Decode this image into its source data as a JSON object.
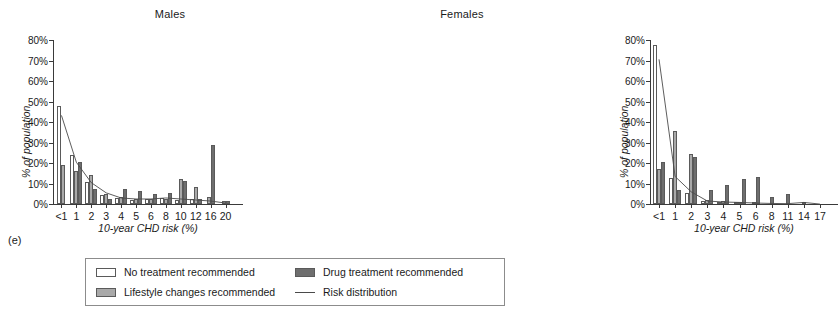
{
  "panel_label": "(e)",
  "legend": {
    "items": [
      {
        "key": "no_treatment",
        "label": "No treatment recommended",
        "marker": "swatch-white",
        "color": "#ffffff"
      },
      {
        "key": "drug",
        "label": "Drug treatment recommended",
        "marker": "swatch-dark-gray",
        "color": "#6e6e6e"
      },
      {
        "key": "lifestyle",
        "label": "Lifestyle changes recommended",
        "marker": "swatch-light-gray",
        "color": "#a9a9a9"
      },
      {
        "key": "risk",
        "label": "Risk distribution",
        "marker": "line",
        "color": "#4a4a4a"
      }
    ]
  },
  "chart_data": [
    {
      "type": "bar",
      "id": "males",
      "title": "Males",
      "xlabel": "10-year CHD risk (%)",
      "ylabel": "% of population",
      "ylim": [
        0,
        80
      ],
      "yticks": [
        "0%",
        "10%",
        "20%",
        "30%",
        "40%",
        "50%",
        "60%",
        "70%",
        "80%"
      ],
      "ytick_values": [
        0,
        10,
        20,
        30,
        40,
        50,
        60,
        70,
        80
      ],
      "grid": false,
      "legend_position": "below-figure",
      "categories": [
        "<1",
        "1",
        "2",
        "3",
        "4",
        "5",
        "6",
        "8",
        "10",
        "12",
        "16",
        "20"
      ],
      "series": [
        {
          "name": "No treatment recommended",
          "color": "#ffffff",
          "values": [
            48,
            24,
            10.5,
            4.5,
            3,
            2,
            2.5,
            3,
            2,
            2.5,
            0,
            0
          ]
        },
        {
          "name": "Lifestyle changes recommended",
          "color": "#a9a9a9",
          "values": [
            19,
            16,
            14,
            5,
            3.5,
            2.5,
            2.5,
            2.5,
            12,
            8.5,
            3.5,
            1.5
          ]
        },
        {
          "name": "Drug treatment recommended",
          "color": "#6e6e6e",
          "values": [
            0,
            20.5,
            7.5,
            2.5,
            7.5,
            6.5,
            5,
            5.5,
            11,
            2.5,
            29,
            1.5
          ]
        }
      ],
      "risk_distribution": {
        "name": "Risk distribution",
        "color": "#4a4a4a",
        "values": [
          43.5,
          20.5,
          10.5,
          5.5,
          3,
          2.5,
          2.5,
          3,
          2.5,
          2,
          1.5,
          0.5
        ]
      }
    },
    {
      "type": "bar",
      "id": "females",
      "title": "Females",
      "xlabel": "10-year CHD risk (%)",
      "ylabel": "% of population",
      "ylim": [
        0,
        80
      ],
      "yticks": [
        "0%",
        "10%",
        "20%",
        "30%",
        "40%",
        "50%",
        "60%",
        "70%",
        "80%"
      ],
      "ytick_values": [
        0,
        10,
        20,
        30,
        40,
        50,
        60,
        70,
        80
      ],
      "grid": false,
      "legend_position": "below-figure",
      "categories": [
        "<1",
        "1",
        "2",
        "3",
        "4",
        "5",
        "6",
        "8",
        "11",
        "14",
        "17"
      ],
      "series": [
        {
          "name": "No treatment recommended",
          "color": "#ffffff",
          "values": [
            77.5,
            12.5,
            5.5,
            1.5,
            1,
            0.8,
            0,
            0,
            0,
            0,
            0
          ]
        },
        {
          "name": "Lifestyle changes recommended",
          "color": "#a9a9a9",
          "values": [
            17,
            35.5,
            24.5,
            2,
            1.5,
            1,
            0.8,
            0,
            0,
            0,
            0
          ]
        },
        {
          "name": "Drug treatment recommended",
          "color": "#6e6e6e",
          "values": [
            20.5,
            7,
            23,
            7,
            9.5,
            12,
            13,
            3.2,
            5,
            1.2,
            0
          ]
        }
      ],
      "risk_distribution": {
        "name": "Risk distribution",
        "color": "#4a4a4a",
        "values": [
          71,
          13.5,
          6,
          1.5,
          1,
          0.8,
          0.5,
          0.3,
          0.2,
          0.8,
          0
        ]
      }
    }
  ]
}
